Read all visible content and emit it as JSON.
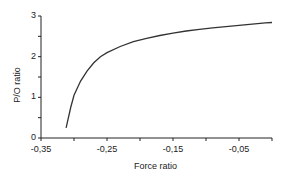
{
  "chart_data": {
    "type": "line",
    "title": "",
    "xlabel": "Force ratio",
    "ylabel": "P/O ratio",
    "xlim": [
      -0.35,
      0.0
    ],
    "ylim": [
      0,
      3
    ],
    "x_ticks": [
      "-0,35",
      "-0,25",
      "-0,15",
      "-0,05"
    ],
    "y_ticks": [
      "0",
      "1",
      "2",
      "3"
    ],
    "grid": false,
    "legend": null,
    "series": [
      {
        "name": "P/O ratio",
        "x": [
          -0.312,
          -0.305,
          -0.3,
          -0.29,
          -0.28,
          -0.27,
          -0.26,
          -0.25,
          -0.23,
          -0.21,
          -0.19,
          -0.17,
          -0.15,
          -0.13,
          -0.11,
          -0.09,
          -0.07,
          -0.05,
          -0.03,
          -0.01,
          0.0
        ],
        "y": [
          0.25,
          0.75,
          1.05,
          1.4,
          1.65,
          1.85,
          2.0,
          2.1,
          2.25,
          2.37,
          2.45,
          2.52,
          2.58,
          2.63,
          2.67,
          2.71,
          2.74,
          2.77,
          2.8,
          2.83,
          2.84
        ]
      }
    ]
  }
}
